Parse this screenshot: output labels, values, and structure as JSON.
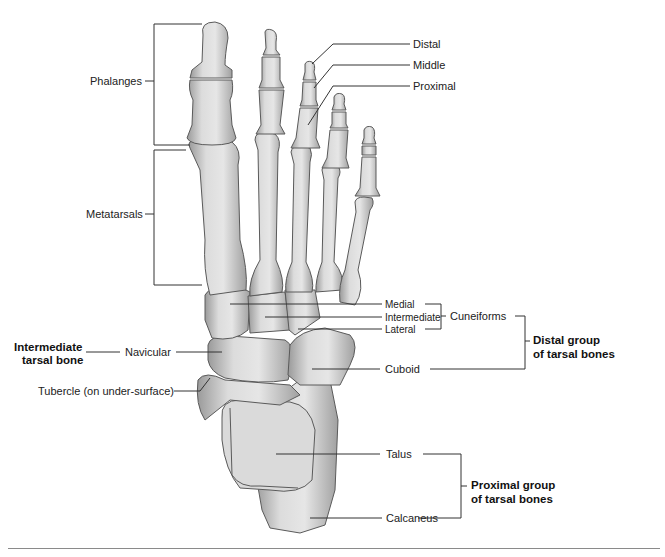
{
  "diagram": {
    "labels": {
      "phalanges": "Phalanges",
      "metatarsals": "Metatarsals",
      "distal": "Distal",
      "middle": "Middle",
      "proximal": "Proximal",
      "medial": "Medial",
      "intermediate": "Intermediate",
      "lateral": "Lateral",
      "cuneiforms": "Cuneiforms",
      "cuboid": "Cuboid",
      "navicular": "Navicular",
      "tubercle": "Tubercle (on under-surface)",
      "talus": "Talus",
      "calcaneus": "Calcaneus"
    },
    "group_labels": {
      "intermediate_tarsal_line1": "Intermediate",
      "intermediate_tarsal_line2": "tarsal bone",
      "distal_group_line1": "Distal group",
      "distal_group_line2": "of tarsal bones",
      "proximal_group_line1": "Proximal group",
      "proximal_group_line2": "of tarsal bones"
    },
    "colors": {
      "bone_light": "#e4e4e4",
      "bone_mid": "#c4c4c4",
      "bone_dark": "#8f8f8f",
      "outline": "#5a5a5a",
      "leader": "#333333"
    }
  }
}
